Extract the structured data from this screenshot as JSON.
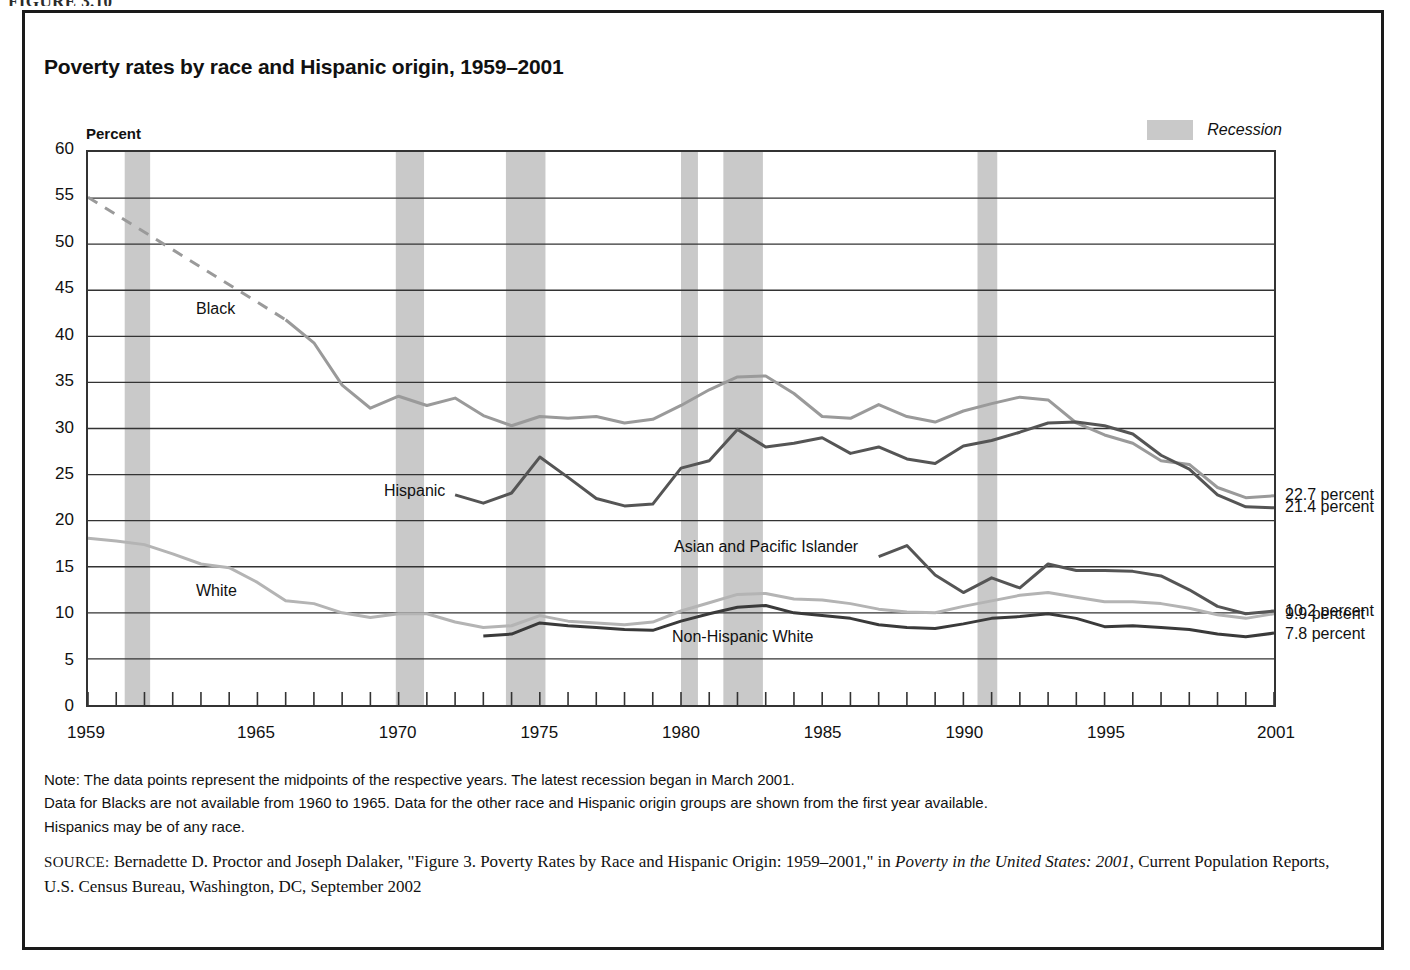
{
  "figure_tag": "FIGURE 3.10",
  "title": "Poverty rates by race and Hispanic origin, 1959–2001",
  "axis": {
    "y_title": "Percent",
    "y_ticks": [
      0,
      5,
      10,
      15,
      20,
      25,
      30,
      35,
      40,
      45,
      50,
      55,
      60
    ],
    "x_labels": [
      "1959",
      "1965",
      "1970",
      "1975",
      "1980",
      "1985",
      "1990",
      "1995",
      "2001"
    ]
  },
  "legend": {
    "recession_label": "Recession",
    "recession_color": "#c9c9c9"
  },
  "end_labels": [
    {
      "text": "22.7 percent",
      "value": 22.7
    },
    {
      "text": "21.4 percent",
      "value": 21.4
    },
    {
      "text": "10.2 percent",
      "value": 10.2
    },
    {
      "text": "9.9 percent",
      "value": 9.9
    },
    {
      "text": "7.8 percent",
      "value": 7.8
    }
  ],
  "series_labels": [
    {
      "name": "Black",
      "text": "Black"
    },
    {
      "name": "Hispanic",
      "text": "Hispanic"
    },
    {
      "name": "White",
      "text": "White"
    },
    {
      "name": "Asian and Pacific Islander",
      "text": "Asian and Pacific Islander"
    },
    {
      "name": "Non-Hispanic White",
      "text": "Non-Hispanic White"
    }
  ],
  "note": {
    "line1": "Note:  The data points represent the midpoints of the respective years.  The latest recession began in March 2001.",
    "line2": "Data for Blacks are not available from 1960 to 1965.  Data for the other race and Hispanic origin groups are shown from the first year available.",
    "line3": "Hispanics may be of any race."
  },
  "source": {
    "prefix": "SOURCE:",
    "part1": " Bernadette D. Proctor and Joseph Dalaker, \"Figure 3. Poverty Rates by Race and Hispanic Origin: 1959–2001,\" in ",
    "italic1": "Poverty in the United States: 2001",
    "part2": ", Current Population Reports, U.S. Census Bureau, Washington, DC, September 2002"
  },
  "chart_data": {
    "type": "line",
    "title": "Poverty rates by race and Hispanic origin, 1959–2001",
    "xlabel": "",
    "ylabel": "Percent",
    "xlim": [
      1959,
      2001
    ],
    "ylim": [
      0,
      60
    ],
    "grid": "horizontal",
    "legend_position": "inline-labels",
    "x": [
      1959,
      1960,
      1961,
      1962,
      1963,
      1964,
      1965,
      1966,
      1967,
      1968,
      1969,
      1970,
      1971,
      1972,
      1973,
      1974,
      1975,
      1976,
      1977,
      1978,
      1979,
      1980,
      1981,
      1982,
      1983,
      1984,
      1985,
      1986,
      1987,
      1988,
      1989,
      1990,
      1991,
      1992,
      1993,
      1994,
      1995,
      1996,
      1997,
      1998,
      1999,
      2000,
      2001
    ],
    "recessions": [
      {
        "start": 1960.3,
        "end": 1961.2
      },
      {
        "start": 1969.9,
        "end": 1970.9
      },
      {
        "start": 1973.8,
        "end": 1975.2
      },
      {
        "start": 1980.0,
        "end": 1980.6
      },
      {
        "start": 1981.5,
        "end": 1982.9
      },
      {
        "start": 1990.5,
        "end": 1991.2
      },
      {
        "start": 2001.2,
        "end": 2001.9
      }
    ],
    "series": [
      {
        "name": "Black",
        "color": "#9a9a9a",
        "width": 3,
        "label_value": 22.7,
        "dashed_segment": {
          "from": 1959,
          "to": 1966,
          "note": "Data not available 1960 to 1965"
        },
        "points": [
          {
            "x": 1959,
            "y": 55.1
          },
          {
            "x": 1966,
            "y": 41.8
          },
          {
            "x": 1967,
            "y": 39.3
          },
          {
            "x": 1968,
            "y": 34.7
          },
          {
            "x": 1969,
            "y": 32.2
          },
          {
            "x": 1970,
            "y": 33.5
          },
          {
            "x": 1971,
            "y": 32.5
          },
          {
            "x": 1972,
            "y": 33.3
          },
          {
            "x": 1973,
            "y": 31.4
          },
          {
            "x": 1974,
            "y": 30.3
          },
          {
            "x": 1975,
            "y": 31.3
          },
          {
            "x": 1976,
            "y": 31.1
          },
          {
            "x": 1977,
            "y": 31.3
          },
          {
            "x": 1978,
            "y": 30.6
          },
          {
            "x": 1979,
            "y": 31.0
          },
          {
            "x": 1980,
            "y": 32.5
          },
          {
            "x": 1981,
            "y": 34.2
          },
          {
            "x": 1982,
            "y": 35.6
          },
          {
            "x": 1983,
            "y": 35.7
          },
          {
            "x": 1984,
            "y": 33.8
          },
          {
            "x": 1985,
            "y": 31.3
          },
          {
            "x": 1986,
            "y": 31.1
          },
          {
            "x": 1987,
            "y": 32.6
          },
          {
            "x": 1988,
            "y": 31.3
          },
          {
            "x": 1989,
            "y": 30.7
          },
          {
            "x": 1990,
            "y": 31.9
          },
          {
            "x": 1991,
            "y": 32.7
          },
          {
            "x": 1992,
            "y": 33.4
          },
          {
            "x": 1993,
            "y": 33.1
          },
          {
            "x": 1994,
            "y": 30.6
          },
          {
            "x": 1995,
            "y": 29.3
          },
          {
            "x": 1996,
            "y": 28.4
          },
          {
            "x": 1997,
            "y": 26.5
          },
          {
            "x": 1998,
            "y": 26.1
          },
          {
            "x": 1999,
            "y": 23.6
          },
          {
            "x": 2000,
            "y": 22.5
          },
          {
            "x": 2001,
            "y": 22.7
          }
        ]
      },
      {
        "name": "Hispanic",
        "color": "#555555",
        "width": 3,
        "label_value": 21.4,
        "points": [
          {
            "x": 1972,
            "y": 22.8
          },
          {
            "x": 1973,
            "y": 21.9
          },
          {
            "x": 1974,
            "y": 23.0
          },
          {
            "x": 1975,
            "y": 26.9
          },
          {
            "x": 1976,
            "y": 24.7
          },
          {
            "x": 1977,
            "y": 22.4
          },
          {
            "x": 1978,
            "y": 21.6
          },
          {
            "x": 1979,
            "y": 21.8
          },
          {
            "x": 1980,
            "y": 25.7
          },
          {
            "x": 1981,
            "y": 26.5
          },
          {
            "x": 1982,
            "y": 29.9
          },
          {
            "x": 1983,
            "y": 28.0
          },
          {
            "x": 1984,
            "y": 28.4
          },
          {
            "x": 1985,
            "y": 29.0
          },
          {
            "x": 1986,
            "y": 27.3
          },
          {
            "x": 1987,
            "y": 28.0
          },
          {
            "x": 1988,
            "y": 26.7
          },
          {
            "x": 1989,
            "y": 26.2
          },
          {
            "x": 1990,
            "y": 28.1
          },
          {
            "x": 1991,
            "y": 28.7
          },
          {
            "x": 1992,
            "y": 29.6
          },
          {
            "x": 1993,
            "y": 30.6
          },
          {
            "x": 1994,
            "y": 30.7
          },
          {
            "x": 1995,
            "y": 30.3
          },
          {
            "x": 1996,
            "y": 29.4
          },
          {
            "x": 1997,
            "y": 27.1
          },
          {
            "x": 1998,
            "y": 25.6
          },
          {
            "x": 1999,
            "y": 22.8
          },
          {
            "x": 2000,
            "y": 21.5
          },
          {
            "x": 2001,
            "y": 21.4
          }
        ]
      },
      {
        "name": "White",
        "color": "#b4b4b4",
        "width": 3,
        "label_value": 9.9,
        "points": [
          {
            "x": 1959,
            "y": 18.1
          },
          {
            "x": 1960,
            "y": 17.8
          },
          {
            "x": 1961,
            "y": 17.4
          },
          {
            "x": 1962,
            "y": 16.4
          },
          {
            "x": 1963,
            "y": 15.3
          },
          {
            "x": 1964,
            "y": 14.9
          },
          {
            "x": 1965,
            "y": 13.3
          },
          {
            "x": 1966,
            "y": 11.3
          },
          {
            "x": 1967,
            "y": 11.0
          },
          {
            "x": 1968,
            "y": 10.0
          },
          {
            "x": 1969,
            "y": 9.5
          },
          {
            "x": 1970,
            "y": 9.9
          },
          {
            "x": 1971,
            "y": 9.9
          },
          {
            "x": 1972,
            "y": 9.0
          },
          {
            "x": 1973,
            "y": 8.4
          },
          {
            "x": 1974,
            "y": 8.6
          },
          {
            "x": 1975,
            "y": 9.7
          },
          {
            "x": 1976,
            "y": 9.1
          },
          {
            "x": 1977,
            "y": 8.9
          },
          {
            "x": 1978,
            "y": 8.7
          },
          {
            "x": 1979,
            "y": 9.0
          },
          {
            "x": 1980,
            "y": 10.2
          },
          {
            "x": 1981,
            "y": 11.1
          },
          {
            "x": 1982,
            "y": 12.0
          },
          {
            "x": 1983,
            "y": 12.1
          },
          {
            "x": 1984,
            "y": 11.5
          },
          {
            "x": 1985,
            "y": 11.4
          },
          {
            "x": 1986,
            "y": 11.0
          },
          {
            "x": 1987,
            "y": 10.4
          },
          {
            "x": 1988,
            "y": 10.1
          },
          {
            "x": 1989,
            "y": 10.0
          },
          {
            "x": 1990,
            "y": 10.7
          },
          {
            "x": 1991,
            "y": 11.3
          },
          {
            "x": 1992,
            "y": 11.9
          },
          {
            "x": 1993,
            "y": 12.2
          },
          {
            "x": 1994,
            "y": 11.7
          },
          {
            "x": 1995,
            "y": 11.2
          },
          {
            "x": 1996,
            "y": 11.2
          },
          {
            "x": 1997,
            "y": 11.0
          },
          {
            "x": 1998,
            "y": 10.5
          },
          {
            "x": 1999,
            "y": 9.8
          },
          {
            "x": 2000,
            "y": 9.4
          },
          {
            "x": 2001,
            "y": 9.9
          }
        ]
      },
      {
        "name": "Asian and Pacific Islander",
        "color": "#555555",
        "width": 3,
        "label_value": 10.2,
        "points": [
          {
            "x": 1987,
            "y": 16.1
          },
          {
            "x": 1988,
            "y": 17.3
          },
          {
            "x": 1989,
            "y": 14.1
          },
          {
            "x": 1990,
            "y": 12.2
          },
          {
            "x": 1991,
            "y": 13.8
          },
          {
            "x": 1992,
            "y": 12.7
          },
          {
            "x": 1993,
            "y": 15.3
          },
          {
            "x": 1994,
            "y": 14.6
          },
          {
            "x": 1995,
            "y": 14.6
          },
          {
            "x": 1996,
            "y": 14.5
          },
          {
            "x": 1997,
            "y": 14.0
          },
          {
            "x": 1998,
            "y": 12.5
          },
          {
            "x": 1999,
            "y": 10.7
          },
          {
            "x": 2000,
            "y": 9.9
          },
          {
            "x": 2001,
            "y": 10.2
          }
        ]
      },
      {
        "name": "Non-Hispanic White",
        "color": "#3a3a3a",
        "width": 3,
        "label_value": 7.8,
        "points": [
          {
            "x": 1973,
            "y": 7.5
          },
          {
            "x": 1974,
            "y": 7.7
          },
          {
            "x": 1975,
            "y": 8.9
          },
          {
            "x": 1976,
            "y": 8.6
          },
          {
            "x": 1977,
            "y": 8.4
          },
          {
            "x": 1978,
            "y": 8.2
          },
          {
            "x": 1979,
            "y": 8.1
          },
          {
            "x": 1980,
            "y": 9.1
          },
          {
            "x": 1981,
            "y": 9.9
          },
          {
            "x": 1982,
            "y": 10.6
          },
          {
            "x": 1983,
            "y": 10.8
          },
          {
            "x": 1984,
            "y": 10.0
          },
          {
            "x": 1985,
            "y": 9.7
          },
          {
            "x": 1986,
            "y": 9.4
          },
          {
            "x": 1987,
            "y": 8.7
          },
          {
            "x": 1988,
            "y": 8.4
          },
          {
            "x": 1989,
            "y": 8.3
          },
          {
            "x": 1990,
            "y": 8.8
          },
          {
            "x": 1991,
            "y": 9.4
          },
          {
            "x": 1992,
            "y": 9.6
          },
          {
            "x": 1993,
            "y": 9.9
          },
          {
            "x": 1994,
            "y": 9.4
          },
          {
            "x": 1995,
            "y": 8.5
          },
          {
            "x": 1996,
            "y": 8.6
          },
          {
            "x": 1997,
            "y": 8.4
          },
          {
            "x": 1998,
            "y": 8.2
          },
          {
            "x": 1999,
            "y": 7.7
          },
          {
            "x": 2000,
            "y": 7.4
          },
          {
            "x": 2001,
            "y": 7.8
          }
        ]
      }
    ]
  }
}
